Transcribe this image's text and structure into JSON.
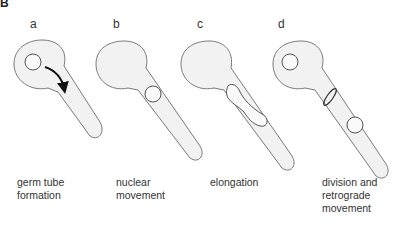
{
  "figure": {
    "panel_label": "B",
    "stages": [
      {
        "letter": "a",
        "caption_line1": "germ tube",
        "caption_line2": "formation",
        "caption_line3": ""
      },
      {
        "letter": "b",
        "caption_line1": "nuclear",
        "caption_line2": "movement",
        "caption_line3": ""
      },
      {
        "letter": "c",
        "caption_line1": "elongation",
        "caption_line2": "",
        "caption_line3": ""
      },
      {
        "letter": "d",
        "caption_line1": "division and",
        "caption_line2": "retrograde",
        "caption_line3": "movement"
      }
    ],
    "colors": {
      "cell_fill": "#f2f2f2",
      "cell_stroke": "#7a7a7a",
      "nucleus_stroke": "#555555",
      "arrow": "#111111"
    }
  }
}
